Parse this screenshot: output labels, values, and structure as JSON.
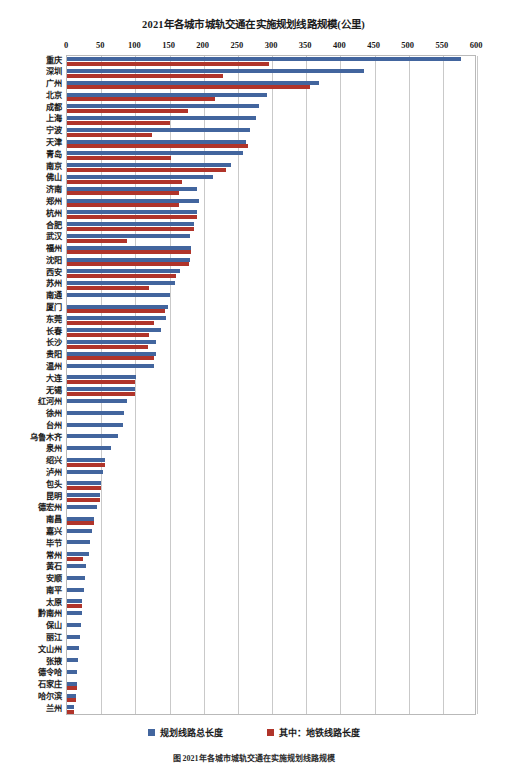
{
  "chart_data": {
    "type": "bar",
    "orientation": "horizontal",
    "title": "2021年各城市城轨交通在实施规划线路规模(公里)",
    "xlabel": "",
    "ylabel": "",
    "xlim": [
      0,
      600
    ],
    "xticks": [
      0,
      50,
      100,
      150,
      200,
      250,
      300,
      350,
      400,
      450,
      500,
      550,
      600
    ],
    "grid": true,
    "legend_position": "bottom",
    "colors": {
      "total": "#42659e",
      "metro": "#b0342a",
      "grid": "#c9c9c9",
      "border": "#b9b9b9"
    },
    "series": [
      {
        "name": "规划线路总长度",
        "key": "total",
        "color": "#42659e"
      },
      {
        "name": "其中：地铁线路长度",
        "key": "metro",
        "color": "#b0342a"
      }
    ],
    "categories": [
      "重庆",
      "深圳",
      "广州",
      "北京",
      "成都",
      "上海",
      "宁波",
      "天津",
      "青岛",
      "南京",
      "佛山",
      "济南",
      "郑州",
      "杭州",
      "合肥",
      "武汉",
      "福州",
      "沈阳",
      "西安",
      "苏州",
      "南通",
      "厦门",
      "东莞",
      "长春",
      "长沙",
      "贵阳",
      "温州",
      "大连",
      "无锡",
      "红河州",
      "徐州",
      "台州",
      "乌鲁木齐",
      "泉州",
      "绍兴",
      "泸州",
      "包头",
      "昆明",
      "德宏州",
      "南昌",
      "嘉兴",
      "毕节",
      "常州",
      "黄石",
      "安顺",
      "南平",
      "太原",
      "黔南州",
      "保山",
      "丽江",
      "文山州",
      "张掖",
      "德令哈",
      "石家庄",
      "哈尔滨",
      "兰州"
    ],
    "values_total": [
      577,
      435,
      369,
      292,
      281,
      277,
      268,
      262,
      258,
      240,
      213,
      190,
      193,
      190,
      186,
      180,
      182,
      180,
      166,
      158,
      151,
      148,
      145,
      137,
      130,
      130,
      128,
      101,
      100,
      88,
      84,
      82,
      74,
      64,
      55,
      52,
      50,
      48,
      44,
      40,
      36,
      33,
      32,
      28,
      26,
      25,
      22,
      22,
      20,
      19,
      18,
      16,
      15,
      14,
      13,
      10
    ],
    "values_metro": [
      295,
      228,
      355,
      217,
      177,
      150,
      124,
      265,
      152,
      233,
      168,
      164,
      164,
      190,
      186,
      88,
      181,
      178,
      159,
      120,
      0,
      143,
      128,
      120,
      119,
      128,
      0,
      100,
      99,
      0,
      0,
      0,
      0,
      0,
      55,
      0,
      50,
      48,
      0,
      40,
      0,
      0,
      24,
      0,
      0,
      0,
      22,
      0,
      0,
      0,
      0,
      0,
      0,
      14,
      13,
      10
    ]
  },
  "legend": {
    "items": [
      {
        "label": "规划线路总长度"
      },
      {
        "label": "其中：地铁线路长度"
      }
    ]
  },
  "caption": {
    "text": "图 2021年各城市城轨交通在实施规划线路规模"
  }
}
